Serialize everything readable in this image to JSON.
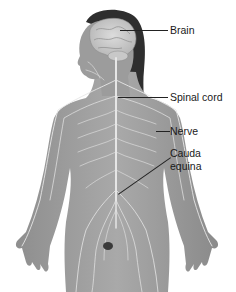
{
  "diagram": {
    "labels": [
      {
        "id": "brain",
        "text": "Brain"
      },
      {
        "id": "spinal-cord",
        "text": "Spinal cord"
      },
      {
        "id": "nerve",
        "text": "Nerve"
      },
      {
        "id": "cauda-equina-line1",
        "text": "Cauda"
      },
      {
        "id": "cauda-equina-line2",
        "text": "equina"
      }
    ]
  }
}
